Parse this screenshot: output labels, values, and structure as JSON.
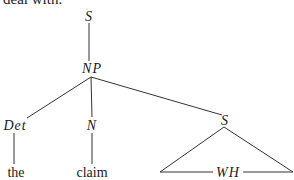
{
  "caption": "deal with.",
  "tree": {
    "root": {
      "label": "S"
    },
    "np": {
      "label": "NP"
    },
    "det": {
      "label": "Det",
      "leaf": "the"
    },
    "n": {
      "label": "N",
      "leaf": "claim"
    },
    "s2": {
      "label": "S"
    },
    "wh": {
      "label": "WH"
    }
  },
  "colors": {
    "line": "#333333",
    "text": "#1a1a1a",
    "background": "#ffffff"
  }
}
